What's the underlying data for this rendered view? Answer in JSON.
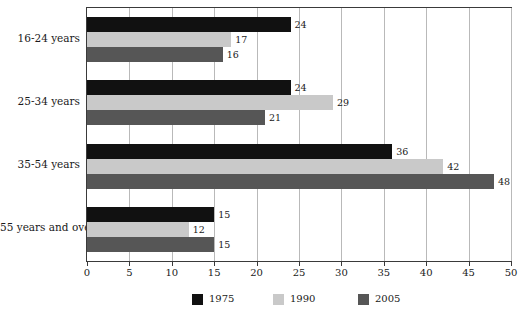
{
  "chart_data": {
    "type": "bar",
    "orientation": "horizontal",
    "title": "",
    "subtitle": "",
    "xlabel": "",
    "ylabel": "",
    "xlim": [
      0,
      50
    ],
    "xticks": [
      0,
      5,
      10,
      15,
      20,
      25,
      30,
      35,
      40,
      45,
      50
    ],
    "xtick_labels": [
      "0",
      "5",
      "10",
      "15",
      "20",
      "25",
      "30",
      "35",
      "40",
      "45",
      "50"
    ],
    "grid": true,
    "grid_axis": "x",
    "legend_position": "bottom",
    "categories": [
      "16-24 years",
      "25-34 years",
      "35-54 years",
      "55 years and over"
    ],
    "series": [
      {
        "name": "1975",
        "color": "#111111",
        "values": [
          24,
          24,
          36,
          15
        ],
        "value_labels": [
          "24",
          "24",
          "36",
          "15"
        ]
      },
      {
        "name": "1990",
        "color": "#c9c9c9",
        "values": [
          17,
          29,
          42,
          12
        ],
        "value_labels": [
          "17",
          "29",
          "42",
          "12"
        ]
      },
      {
        "name": "2005",
        "color": "#565656",
        "values": [
          16,
          21,
          48,
          15
        ],
        "value_labels": [
          "16",
          "21",
          "48",
          "15"
        ]
      }
    ]
  },
  "legend": {
    "items": [
      {
        "label": "1975",
        "color": "#111111"
      },
      {
        "label": "1990",
        "color": "#c9c9c9"
      },
      {
        "label": "2005",
        "color": "#565656"
      }
    ]
  },
  "axis": {
    "x_tick_labels": [
      "0",
      "5",
      "10",
      "15",
      "20",
      "25",
      "30",
      "35",
      "40",
      "45",
      "50"
    ]
  },
  "categories": [
    "16-24 years",
    "25-34 years",
    "35-54 years",
    "55 years and over"
  ],
  "colors": {
    "series_1975": "#111111",
    "series_1990": "#c9c9c9",
    "series_2005": "#565656",
    "grid": "#b9b9b9",
    "axis": "#3a3a3a",
    "background": "#ffffff",
    "text": "#1a1a1a"
  }
}
